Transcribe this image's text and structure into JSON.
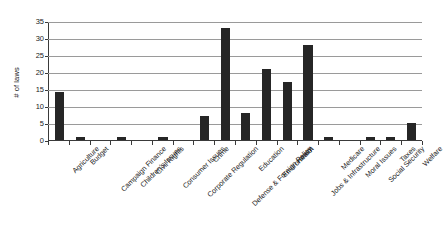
{
  "chart_data": {
    "type": "bar",
    "title": "",
    "xlabel": "",
    "ylabel": "# of laws",
    "ylim": [
      0,
      35
    ],
    "ytick_step": 5,
    "yticks": [
      0,
      5,
      10,
      15,
      20,
      25,
      30,
      35
    ],
    "grid": true,
    "legend": null,
    "bar_color": "#262626",
    "gridline_color": "#9a9a9a",
    "axis_color": "#3a3a3a",
    "categories": [
      "Agriculture",
      "Budget",
      "Campaign Finance",
      "Children's Issues",
      "Civil Rights",
      "Consumer Issues",
      "Corporate Regulation",
      "Crime",
      "Defense & Foreign Policy",
      "Education",
      "Environment",
      "Health",
      "Jobs & Infrastructure",
      "Medicare",
      "Moral Issues",
      "Social Security",
      "Taxes",
      "Welfare"
    ],
    "values": [
      14,
      1,
      0,
      1,
      0,
      1,
      0,
      7,
      33,
      8,
      21,
      17,
      28,
      1,
      0,
      1,
      1,
      5
    ]
  }
}
